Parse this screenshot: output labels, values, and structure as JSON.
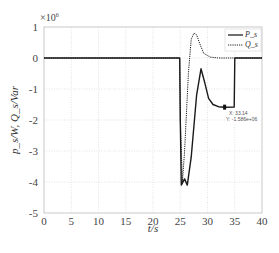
{
  "chart_data": {
    "type": "line",
    "title": "",
    "xlabel": "t/s",
    "ylabel": "p_s/W, Q_s/Var",
    "y_multiplier": "×10^6",
    "xlim": [
      0,
      40
    ],
    "ylim": [
      -5,
      1
    ],
    "x_ticks": [
      "0",
      "5",
      "10",
      "15",
      "20",
      "25",
      "30",
      "35",
      "40"
    ],
    "y_ticks": [
      "1",
      "0",
      "-1",
      "-2",
      "-3",
      "-4",
      "-5"
    ],
    "grid": true,
    "legend_position": "top-right",
    "series": [
      {
        "name": "P_s",
        "style": "solid",
        "x": [
          0,
          24.9,
          25.0,
          25.2,
          25.8,
          26.3,
          27.0,
          28.0,
          28.8,
          29.5,
          30.2,
          31.0,
          32.0,
          33.14,
          34.9,
          35.0,
          40
        ],
        "y": [
          0,
          0,
          -2.0,
          -4.1,
          -3.9,
          -4.1,
          -3.2,
          -1.2,
          -0.35,
          -0.8,
          -1.3,
          -1.5,
          -1.57,
          -1.586,
          -1.58,
          0.0,
          0.0
        ]
      },
      {
        "name": "Q_s",
        "style": "dotted",
        "x": [
          0,
          24.9,
          25.0,
          25.4,
          25.8,
          26.5,
          27.0,
          27.5,
          28.0,
          28.6,
          29.3,
          30.5,
          32.0,
          35.0,
          40
        ],
        "y": [
          0,
          0,
          -2.0,
          -4.0,
          -3.0,
          -0.5,
          0.6,
          0.8,
          0.75,
          0.45,
          0.15,
          0.03,
          0.0,
          0.0,
          0.0
        ]
      }
    ],
    "annotations": [
      {
        "type": "datatip",
        "x_label": "X: 33.14",
        "y_label": "Y: -1.586e+06",
        "x": 33.14,
        "y": -1.586
      }
    ]
  },
  "legend": {
    "items": [
      "P_s",
      "Q_s"
    ]
  },
  "datatip": {
    "x": "X: 33.14",
    "y": "Y: -1.586e+06"
  },
  "axes": {
    "xlabel": "t/s",
    "ylabel": "p_s/W, Q_s/Var",
    "multiplier": "×10",
    "multiplier_exp": "6"
  }
}
